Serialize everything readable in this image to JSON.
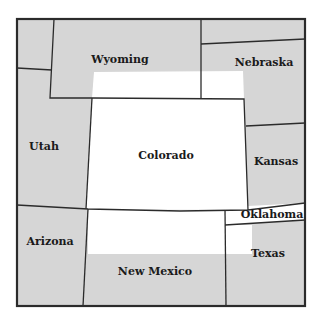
{
  "map": {
    "title": "",
    "colors": {
      "shade": "#d6d6d6",
      "highlight": "#ffffff",
      "border": "#2b2b2b"
    },
    "states": [
      {
        "name": "Wyoming",
        "label_x": 120,
        "label_y": 63
      },
      {
        "name": "Nebraska",
        "label_x": 264,
        "label_y": 66
      },
      {
        "name": "Utah",
        "label_x": 44,
        "label_y": 150
      },
      {
        "name": "Colorado",
        "label_x": 166,
        "label_y": 159
      },
      {
        "name": "Kansas",
        "label_x": 276,
        "label_y": 165
      },
      {
        "name": "Oklahoma",
        "label_x": 272,
        "label_y": 217
      },
      {
        "name": "Arizona",
        "label_x": 50,
        "label_y": 245
      },
      {
        "name": "New Mexico",
        "label_x": 155,
        "label_y": 275
      },
      {
        "name": "Texas",
        "label_x": 268,
        "label_y": 257
      }
    ]
  }
}
